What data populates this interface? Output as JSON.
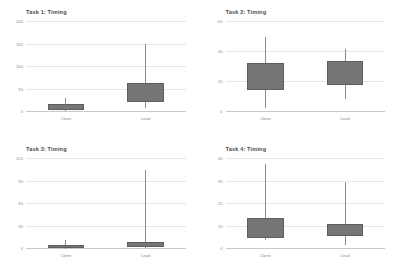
{
  "figure": {
    "layout": "2x2 grid of box plots",
    "background_color": "#ffffff",
    "box_color": "#767676",
    "gridline_color": "#e6e6e6",
    "axis_color": "#c9c9c9",
    "label_color": "#8c8c8c"
  },
  "chart_data": [
    {
      "type": "box",
      "title": "Task 1: Timing",
      "xlabel": "",
      "ylabel": "",
      "ylim": [
        0,
        200
      ],
      "yticks": [
        0,
        50,
        100,
        150,
        200
      ],
      "ytick_labels": [
        "0",
        "50",
        "100",
        "150",
        "200"
      ],
      "grid": true,
      "legend": "none",
      "categories": [
        "Clone",
        "Lead"
      ],
      "boxes": [
        {
          "label": "Clone",
          "whisker_low": 2,
          "q1": 5,
          "median": 11,
          "q3": 17,
          "whisker_high": 31
        },
        {
          "label": "Lead",
          "whisker_low": 8,
          "q1": 22,
          "median": 52,
          "q3": 64,
          "whisker_high": 152
        }
      ]
    },
    {
      "type": "box",
      "title": "Task 2: Timing",
      "xlabel": "",
      "ylabel": "",
      "ylim": [
        0,
        60
      ],
      "yticks": [
        0,
        20,
        40,
        60
      ],
      "ytick_labels": [
        "0",
        "20",
        "40",
        "60"
      ],
      "grid": true,
      "legend": "none",
      "categories": [
        "Clone",
        "Lead"
      ],
      "boxes": [
        {
          "label": "Clone",
          "whisker_low": 3,
          "q1": 15,
          "median": 26,
          "q3": 33,
          "whisker_high": 50
        },
        {
          "label": "Lead",
          "whisker_low": 9,
          "q1": 18,
          "median": 27,
          "q3": 34,
          "whisker_high": 42
        }
      ]
    },
    {
      "type": "box",
      "title": "Task 3: Timing",
      "xlabel": "",
      "ylabel": "",
      "ylim": [
        0,
        120
      ],
      "yticks": [
        0,
        30,
        60,
        90,
        120
      ],
      "ytick_labels": [
        "0",
        "30",
        "60",
        "90",
        "120"
      ],
      "grid": true,
      "legend": "none",
      "categories": [
        "Clone",
        "Lead"
      ],
      "boxes": [
        {
          "label": "Clone",
          "whisker_low": 1,
          "q1": 2,
          "median": 4,
          "q3": 6,
          "whisker_high": 12
        },
        {
          "label": "Lead",
          "whisker_low": 1,
          "q1": 3,
          "median": 7,
          "q3": 10,
          "whisker_high": 105
        }
      ]
    },
    {
      "type": "box",
      "title": "Task 4: Timing",
      "xlabel": "",
      "ylabel": "",
      "ylim": [
        0,
        40
      ],
      "yticks": [
        0,
        10,
        20,
        30,
        40
      ],
      "ytick_labels": [
        "0",
        "10",
        "20",
        "30",
        "40"
      ],
      "grid": true,
      "legend": "none",
      "categories": [
        "Clone",
        "Lead"
      ],
      "boxes": [
        {
          "label": "Clone",
          "whisker_low": 4,
          "q1": 5,
          "median": 9,
          "q3": 14,
          "whisker_high": 38
        },
        {
          "label": "Lead",
          "whisker_low": 2,
          "q1": 6,
          "median": 8,
          "q3": 11,
          "whisker_high": 30
        }
      ]
    }
  ]
}
